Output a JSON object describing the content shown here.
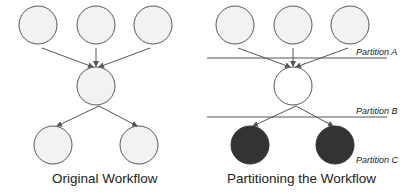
{
  "left_panel": {
    "caption": "Original Workflow",
    "node_fill": "#f2f2f2",
    "stroke": "#555555"
  },
  "right_panel": {
    "caption": "Partitioning the Workflow",
    "partitions": [
      {
        "label": "Partition A"
      },
      {
        "label": "Partition B"
      },
      {
        "label": "Partition C"
      }
    ],
    "top_fill": "#f2f2f2",
    "middle_fill": "#ffffff",
    "bottom_fill": "#333333",
    "stroke": "#555555"
  }
}
